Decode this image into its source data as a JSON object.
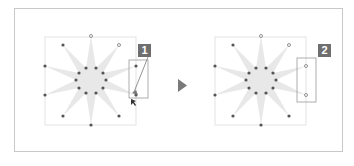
{
  "diagram": {
    "steps": [
      {
        "badge": "1",
        "action": "drag selection marquee around right-side vertices"
      },
      {
        "badge": "2",
        "action": "vertices selected"
      }
    ],
    "colors": {
      "star_fill": "#e8e8e8",
      "vertex": "#555555",
      "bbox": "#e3e3e3",
      "badge_bg": "#6e6e6e",
      "badge_text": "#ffffff",
      "frame": "#c8c8c8",
      "selection": "#999999",
      "arrow": "#7a7a7a"
    }
  }
}
